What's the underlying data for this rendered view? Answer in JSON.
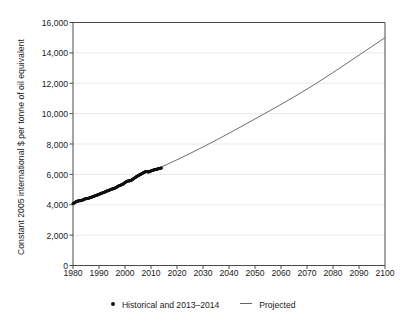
{
  "chart_data": {
    "type": "scatter",
    "title": "",
    "subtitle": "",
    "xlabel": "",
    "ylabel": "Constant 2005 international $ per tonne of oil equivalent",
    "xlim": [
      1980,
      2100
    ],
    "ylim": [
      0,
      16000
    ],
    "grid": "horizontal",
    "legend_position": "bottom",
    "x_ticks": [
      "1980",
      "1990",
      "2000",
      "2010",
      "2020",
      "2030",
      "2040",
      "2050",
      "2060",
      "2070",
      "2080",
      "2090",
      "2100"
    ],
    "x_tick_values": [
      1980,
      1990,
      2000,
      2010,
      2020,
      2030,
      2040,
      2050,
      2060,
      2070,
      2080,
      2090,
      2100
    ],
    "y_ticks": [
      "0",
      "2,000",
      "4,000",
      "6,000",
      "8,000",
      "10,000",
      "12,000",
      "14,000",
      "16,000"
    ],
    "y_tick_values": [
      0,
      2000,
      4000,
      6000,
      8000,
      10000,
      12000,
      14000,
      16000
    ],
    "series": [
      {
        "name": "Historical and 2013–2014",
        "style": "scatter",
        "marker": "dot",
        "color": "#111111",
        "x": [
          1980,
          1980.5,
          1981,
          1981.5,
          1982,
          1982.5,
          1983,
          1983.5,
          1984,
          1984.5,
          1985,
          1985.5,
          1986,
          1986.5,
          1987,
          1987.5,
          1988,
          1988.5,
          1989,
          1989.5,
          1990,
          1990.5,
          1991,
          1991.5,
          1992,
          1992.5,
          1993,
          1993.5,
          1994,
          1994.5,
          1995,
          1995.5,
          1996,
          1996.5,
          1997,
          1997.5,
          1998,
          1998.5,
          1999,
          1999.5,
          2000,
          2000.5,
          2001,
          2001.5,
          2002,
          2002.5,
          2003,
          2003.5,
          2004,
          2004.5,
          2005,
          2005.5,
          2006,
          2006.5,
          2007,
          2007.5,
          2008,
          2008.5,
          2009,
          2009.5,
          2010,
          2010.5,
          2011,
          2011.5,
          2012,
          2012.5,
          2013,
          2013.5,
          2014
        ],
        "y": [
          4080,
          4120,
          4180,
          4230,
          4250,
          4260,
          4270,
          4300,
          4330,
          4380,
          4400,
          4420,
          4430,
          4460,
          4490,
          4520,
          4550,
          4590,
          4620,
          4650,
          4690,
          4720,
          4760,
          4790,
          4820,
          4860,
          4900,
          4930,
          4960,
          5000,
          5030,
          5060,
          5090,
          5130,
          5180,
          5230,
          5270,
          5300,
          5340,
          5390,
          5460,
          5520,
          5560,
          5570,
          5580,
          5620,
          5680,
          5740,
          5800,
          5860,
          5910,
          5960,
          6000,
          6050,
          6100,
          6150,
          6180,
          6180,
          6160,
          6180,
          6230,
          6260,
          6290,
          6310,
          6330,
          6350,
          6380,
          6400,
          6420
        ]
      },
      {
        "name": "Projected",
        "style": "line",
        "color": "#6e6e6e",
        "x": [
          2012,
          2020,
          2030,
          2040,
          2050,
          2060,
          2070,
          2080,
          2090,
          2100
        ],
        "y": [
          6330,
          6950,
          7800,
          8700,
          9650,
          10600,
          11600,
          12700,
          13850,
          15000
        ]
      }
    ],
    "legend": [
      {
        "label": "Historical and 2013–2014",
        "marker": "dot",
        "color": "#111111"
      },
      {
        "label": "Projected",
        "marker": "line",
        "color": "#6e6e6e"
      }
    ]
  },
  "colors": {
    "axis": "#4a4a4a",
    "grid": "#e9e9e9",
    "historical": "#111111",
    "projected": "#6e6e6e",
    "background": "#ffffff",
    "text": "#1a1a1a"
  }
}
